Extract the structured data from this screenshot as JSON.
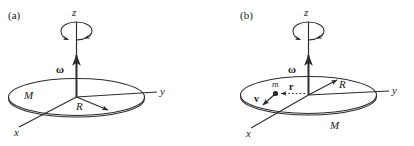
{
  "figure": {
    "background_color": "#ffffff",
    "stroke_color": "#2b2b2b"
  },
  "panels": [
    {
      "id": "a",
      "label": "(a)",
      "axes": {
        "z": "z",
        "y": "y",
        "x": "x"
      },
      "labels": {
        "angular_velocity": "ω",
        "mass": "M",
        "radius": "R"
      }
    },
    {
      "id": "b",
      "label": "(b)",
      "axes": {
        "z": "z",
        "y": "y",
        "x": "x"
      },
      "labels": {
        "angular_velocity": "ω",
        "mass": "M",
        "radius": "R",
        "point_mass": "m",
        "position_vector": "r",
        "velocity_vector": "v"
      }
    }
  ]
}
